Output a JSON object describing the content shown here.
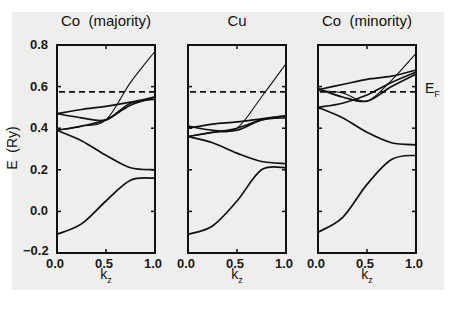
{
  "chart_data": [
    {
      "type": "line",
      "title": "Co  (majority)",
      "xlabel": "k_z",
      "ylabel": "E  (Ry)",
      "xlim": [
        0.0,
        1.0
      ],
      "ylim": [
        -0.2,
        0.8
      ],
      "xticks": [
        "0.0",
        "0.5",
        "1.0"
      ],
      "yticks": [
        "-0.2",
        "0.0",
        "0.2",
        "0.4",
        "0.6",
        "0.8"
      ],
      "fermi_level": 0.575,
      "x": [
        0.0,
        0.25,
        0.5,
        0.75,
        1.0
      ],
      "series": [
        {
          "name": "band1",
          "values": [
            -0.11,
            -0.06,
            0.05,
            0.15,
            0.16
          ]
        },
        {
          "name": "band2",
          "values": [
            0.39,
            0.34,
            0.27,
            0.21,
            0.2
          ]
        },
        {
          "name": "band3",
          "values": [
            0.39,
            0.41,
            0.44,
            0.51,
            0.55
          ]
        },
        {
          "name": "band4",
          "values": [
            0.47,
            0.45,
            0.44,
            0.52,
            0.54
          ]
        },
        {
          "name": "band5",
          "values": [
            0.47,
            0.49,
            0.505,
            0.525,
            0.55
          ]
        },
        {
          "name": "band6",
          "values": [
            0.39,
            0.41,
            0.44,
            0.62,
            0.77
          ]
        }
      ]
    },
    {
      "type": "line",
      "title": "Cu",
      "xlabel": "k_z",
      "xlim": [
        0.0,
        1.0
      ],
      "ylim": [
        -0.2,
        0.8
      ],
      "xticks": [
        "0.0",
        "0.5",
        "1.0"
      ],
      "fermi_level": 0.575,
      "x": [
        0.0,
        0.25,
        0.5,
        0.75,
        1.0
      ],
      "series": [
        {
          "name": "band1",
          "values": [
            -0.11,
            -0.07,
            0.05,
            0.2,
            0.21
          ]
        },
        {
          "name": "band2",
          "values": [
            0.36,
            0.33,
            0.28,
            0.24,
            0.23
          ]
        },
        {
          "name": "band3",
          "values": [
            0.36,
            0.38,
            0.4,
            0.44,
            0.46
          ]
        },
        {
          "name": "band4",
          "values": [
            0.41,
            0.39,
            0.39,
            0.44,
            0.45
          ]
        },
        {
          "name": "band5",
          "values": [
            0.4,
            0.42,
            0.43,
            0.445,
            0.46
          ]
        },
        {
          "name": "band6",
          "values": [
            0.36,
            0.38,
            0.4,
            0.55,
            0.71
          ]
        }
      ]
    },
    {
      "type": "line",
      "title": "Co  (minority)",
      "xlabel": "k_z",
      "xlim": [
        0.0,
        1.0
      ],
      "ylim": [
        -0.2,
        0.8
      ],
      "xticks": [
        "0.0",
        "0.5",
        "1.0"
      ],
      "fermi_level": 0.575,
      "fermi_label": "E_F",
      "x": [
        0.0,
        0.25,
        0.5,
        0.75,
        1.0
      ],
      "series": [
        {
          "name": "band1",
          "values": [
            -0.1,
            -0.03,
            0.13,
            0.25,
            0.27
          ]
        },
        {
          "name": "band2",
          "values": [
            0.5,
            0.45,
            0.38,
            0.33,
            0.32
          ]
        },
        {
          "name": "band3",
          "values": [
            0.5,
            0.52,
            0.56,
            0.62,
            0.67
          ]
        },
        {
          "name": "band4",
          "values": [
            0.59,
            0.55,
            0.53,
            0.6,
            0.66
          ]
        },
        {
          "name": "band5",
          "values": [
            0.585,
            0.61,
            0.635,
            0.65,
            0.68
          ]
        },
        {
          "name": "band6",
          "values": [
            0.58,
            0.57,
            0.53,
            0.63,
            0.76
          ]
        }
      ]
    }
  ],
  "labels": {
    "titles": [
      "Co  (majority)",
      "Cu",
      "Co  (minority)"
    ],
    "ylabel": "E  (Ry)",
    "xlabel_main": "k",
    "xlabel_sub": "z",
    "ef_main": "E",
    "ef_sub": "F",
    "yticks": [
      "0.8",
      "0.6",
      "0.4",
      "0.2",
      "0.0",
      "−0.2"
    ],
    "xticks": [
      "0.0",
      "0.5",
      "1.0"
    ]
  }
}
